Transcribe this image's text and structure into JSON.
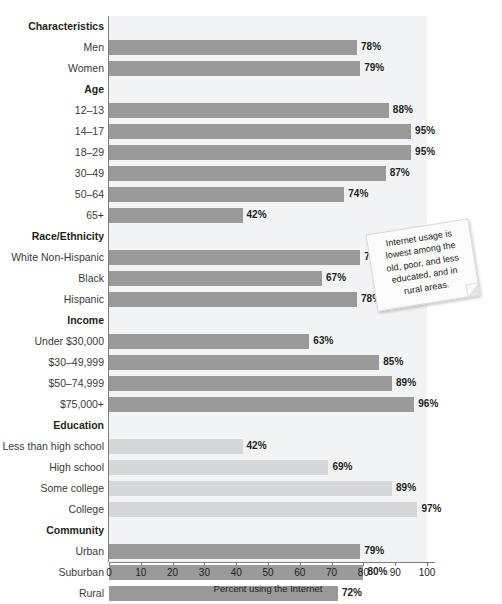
{
  "chart_data": {
    "type": "bar",
    "orientation": "horizontal",
    "title": "",
    "xlabel": "Percent using the Internet",
    "ylabel": "",
    "xlim": [
      0,
      100
    ],
    "xticks": [
      0,
      10,
      20,
      30,
      40,
      50,
      60,
      70,
      80,
      90,
      100
    ],
    "grid": false,
    "legend": false,
    "value_suffix": "%",
    "colors": {
      "bar_default": "#9a9a9a",
      "bar_light": "#d6d7d8",
      "plot_background": "#f2f3f4",
      "axis": "#7d8083",
      "text": "#231f20"
    },
    "sections": [
      {
        "heading": "Characteristics",
        "is_top_heading": true,
        "groups": [
          {
            "name": "",
            "shade": "default",
            "items": [
              {
                "label": "Men",
                "value": 78,
                "value_label": "78%"
              },
              {
                "label": "Women",
                "value": 79,
                "value_label": "79%"
              }
            ]
          }
        ]
      },
      {
        "heading": "Age",
        "is_top_heading": false,
        "groups": [
          {
            "name": "Age",
            "shade": "default",
            "items": [
              {
                "label": "12–13",
                "value": 88,
                "value_label": "88%"
              },
              {
                "label": "14–17",
                "value": 95,
                "value_label": "95%"
              },
              {
                "label": "18–29",
                "value": 95,
                "value_label": "95%"
              },
              {
                "label": "30–49",
                "value": 87,
                "value_label": "87%"
              },
              {
                "label": "50–64",
                "value": 74,
                "value_label": "74%"
              },
              {
                "label": "65+",
                "value": 42,
                "value_label": "42%"
              }
            ]
          }
        ]
      },
      {
        "heading": "Race/Ethnicity",
        "is_top_heading": false,
        "groups": [
          {
            "name": "Race/Ethnicity",
            "shade": "default",
            "items": [
              {
                "label": "White Non-Hispanic",
                "value": 79,
                "value_label": "79%"
              },
              {
                "label": "Black",
                "value": 67,
                "value_label": "67%"
              },
              {
                "label": "Hispanic",
                "value": 78,
                "value_label": "78%"
              }
            ]
          }
        ]
      },
      {
        "heading": "Income",
        "is_top_heading": false,
        "groups": [
          {
            "name": "Income",
            "shade": "default",
            "items": [
              {
                "label": "Under $30,000",
                "value": 63,
                "value_label": "63%"
              },
              {
                "label": "$30–49,999",
                "value": 85,
                "value_label": "85%"
              },
              {
                "label": "$50–74,999",
                "value": 89,
                "value_label": "89%"
              },
              {
                "label": "$75,000+",
                "value": 96,
                "value_label": "96%"
              }
            ]
          }
        ]
      },
      {
        "heading": "Education",
        "is_top_heading": false,
        "groups": [
          {
            "name": "Education",
            "shade": "light",
            "items": [
              {
                "label": "Less than high school",
                "value": 42,
                "value_label": "42%"
              },
              {
                "label": "High school",
                "value": 69,
                "value_label": "69%"
              },
              {
                "label": "Some college",
                "value": 89,
                "value_label": "89%"
              },
              {
                "label": "College",
                "value": 97,
                "value_label": "97%"
              }
            ]
          }
        ]
      },
      {
        "heading": "Community",
        "is_top_heading": false,
        "groups": [
          {
            "name": "Community",
            "shade": "default",
            "items": [
              {
                "label": "Urban",
                "value": 79,
                "value_label": "79%"
              },
              {
                "label": "Suburban",
                "value": 80,
                "value_label": "80%"
              },
              {
                "label": "Rural",
                "value": 72,
                "value_label": "72%"
              }
            ]
          }
        ]
      }
    ],
    "annotations": [
      {
        "id": "callout-note",
        "text": "Internet usage is lowest among the old, poor, and less educated, and in rural areas.",
        "lines": [
          "Internet usage is",
          "lowest among the",
          "old, poor, and less",
          "educated, and in",
          "rural areas."
        ]
      }
    ]
  }
}
